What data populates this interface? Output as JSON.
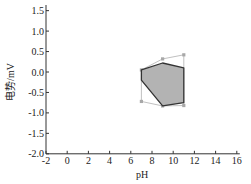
{
  "chart_data": {
    "type": "area",
    "title": "",
    "xlabel": "pH",
    "ylabel": "电势/mV",
    "xlim": [
      -2,
      16
    ],
    "ylim": [
      -2.0,
      1.7
    ],
    "xticks": [
      -2,
      0,
      2,
      4,
      6,
      8,
      10,
      12,
      14,
      16
    ],
    "xtick_labels": [
      "-2",
      "0",
      "2",
      "4",
      "6",
      "8",
      "10",
      "12",
      "14",
      "16"
    ],
    "yticks": [
      -2.0,
      -1.5,
      -1.0,
      -0.5,
      0.0,
      0.5,
      1.0,
      1.5
    ],
    "ytick_labels": [
      "-2.0",
      "-1.5",
      "-1.0",
      "-0.5",
      "0.0",
      "0.5",
      "1.0",
      "1.5"
    ],
    "grid": false,
    "legend": null,
    "series": [
      {
        "name": "shaded region",
        "style": "filled polygon, dark outline",
        "fill": "#b3b3b3",
        "stroke": "#333333",
        "points": [
          [
            7.0,
            0.05
          ],
          [
            9.0,
            0.22
          ],
          [
            11.0,
            0.1
          ],
          [
            11.0,
            -0.75
          ],
          [
            9.0,
            -0.83
          ],
          [
            7.0,
            -0.2
          ]
        ]
      },
      {
        "name": "outer boundary",
        "style": "light line with markers",
        "stroke": "#b0b0b0",
        "points": [
          [
            7.0,
            0.05
          ],
          [
            9.0,
            0.32
          ],
          [
            11.0,
            0.42
          ],
          [
            11.0,
            -0.82
          ],
          [
            9.0,
            -0.83
          ],
          [
            7.0,
            -0.72
          ]
        ]
      }
    ]
  },
  "axes": {
    "x_title": "pH",
    "y_title": "电势/mV"
  }
}
